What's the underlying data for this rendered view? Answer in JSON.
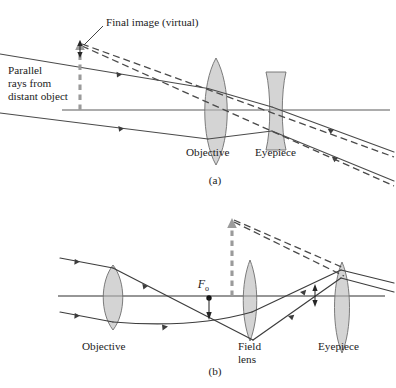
{
  "figure": {
    "title_note": "Telescope ray diagrams",
    "panels": [
      {
        "id": "a",
        "caption": "(a)",
        "labels": {
          "final_image": "Final image (virtual)",
          "incoming_rays": "Parallel rays from distant object",
          "incoming_rays_line1": "Parallel",
          "incoming_rays_line2": "rays from",
          "incoming_rays_line3": "distant object",
          "objective": "Objective",
          "eyepiece": "Eyepiece"
        },
        "optics": {
          "axis_y": 110,
          "objective_center_x": 216,
          "objective_type": "biconvex",
          "eyepiece_center_x": 276,
          "eyepiece_type": "biconcave",
          "virtual_image_x": 80,
          "virtual_image_top_y": 40,
          "virtual_image_base_y": 110
        }
      },
      {
        "id": "b",
        "caption": "(b)",
        "labels": {
          "objective": "Objective",
          "field_lens_line1": "Field",
          "field_lens_line2": "lens",
          "field_lens": "Field lens",
          "eyepiece": "Eyepiece",
          "focal_point": "F",
          "focal_point_sub": "o"
        },
        "optics": {
          "axis_y": 296,
          "objective_center_x": 113,
          "objective_type": "biconvex",
          "field_lens_center_x": 250,
          "field_lens_type": "biconvex",
          "eyepiece_center_x": 342,
          "eyepiece_type": "biconvex",
          "focal_point_x": 209,
          "image_arrow_x": 232,
          "image_arrow_top_y": 218,
          "image_arrow_base_y": 296
        }
      }
    ],
    "colors": {
      "lens_fill": "#b9b9b9",
      "ray_stroke": "#4a4a4a",
      "axis_stroke": "#5a5a5a",
      "image_arrow": "#9b9b9b",
      "text": "#1b1b1b",
      "background": "#ffffff"
    }
  }
}
